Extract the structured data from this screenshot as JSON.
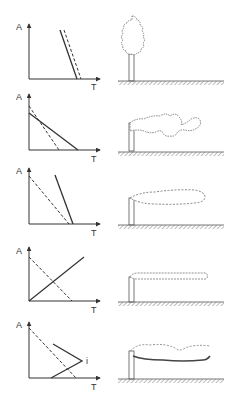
{
  "figure": {
    "axis_labels": {
      "y": "A",
      "x": "T"
    },
    "colors": {
      "ink": "#333333",
      "background": "#ffffff"
    },
    "rows": [
      {
        "id": "looping-vertical",
        "graph": {
          "y_axis_label": "A",
          "x_axis_label": "T",
          "lines": [
            {
              "style": "solid",
              "from": [
                60,
                30
              ],
              "to": [
                77,
                79
              ]
            },
            {
              "style": "dashed",
              "from": [
                64,
                30
              ],
              "to": [
                81,
                79
              ]
            }
          ]
        },
        "scene": {
          "type": "tree",
          "icon": "tree-icon"
        }
      },
      {
        "id": "looping",
        "graph": {
          "y_axis_label": "A",
          "x_axis_label": "T",
          "lines": [
            {
              "style": "solid",
              "from": [
                29,
                113
              ],
              "to": [
                78,
                150
              ]
            },
            {
              "style": "dashed",
              "from": [
                29,
                106
              ],
              "to": [
                59,
                150
              ]
            }
          ]
        },
        "scene": {
          "type": "chimney-plume",
          "plume": "looping",
          "icon": "chimney-looping-plume-icon"
        }
      },
      {
        "id": "coning",
        "graph": {
          "y_axis_label": "A",
          "x_axis_label": "T",
          "lines": [
            {
              "style": "dashed",
              "from": [
                29,
                176
              ],
              "to": [
                69,
                224
              ]
            },
            {
              "style": "solid",
              "from": [
                55,
                175
              ],
              "to": [
                73,
                224
              ]
            }
          ]
        },
        "scene": {
          "type": "chimney-plume",
          "plume": "coning",
          "icon": "chimney-coning-plume-icon"
        }
      },
      {
        "id": "fanning",
        "graph": {
          "y_axis_label": "A",
          "x_axis_label": "T",
          "lines": [
            {
              "style": "dashed",
              "from": [
                29,
                257
              ],
              "to": [
                72,
                301
              ]
            },
            {
              "style": "solid",
              "from": [
                29,
                301
              ],
              "to": [
                84,
                257
              ]
            }
          ]
        },
        "scene": {
          "type": "chimney-plume",
          "plume": "fanning",
          "icon": "chimney-fanning-plume-icon"
        }
      },
      {
        "id": "fumigation",
        "graph": {
          "y_axis_label": "A",
          "x_axis_label": "T",
          "inversion_label": "i",
          "lines": [
            {
              "style": "dashed",
              "from": [
                29,
                328
              ],
              "to": [
                76,
                378
              ]
            },
            {
              "style": "solid",
              "points": [
                [
                  53,
                  344
                ],
                [
                  82,
                  361
                ],
                [
                  51,
                  378
                ]
              ]
            }
          ]
        },
        "scene": {
          "type": "chimney-plume",
          "plume": "fumigation",
          "icon": "chimney-fumigation-plume-icon"
        }
      }
    ]
  }
}
